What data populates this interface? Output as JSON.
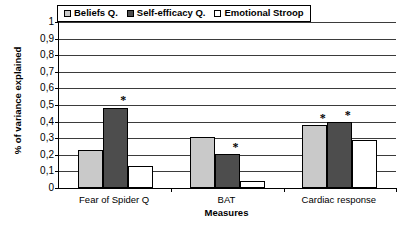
{
  "chart_data": {
    "type": "bar",
    "title": "",
    "xlabel": "Measures",
    "ylabel": "% of variance explained",
    "categories": [
      "Fear of Spider Q",
      "BAT",
      "Cardiac response"
    ],
    "series": [
      {
        "name": "Beliefs Q.",
        "color": "#c9c9c9",
        "values": [
          0.23,
          0.305,
          0.38
        ]
      },
      {
        "name": "Self-efficacy Q.",
        "color": "#4d4d4d",
        "values": [
          0.485,
          0.205,
          0.4
        ]
      },
      {
        "name": "Emotional Stroop",
        "color": "#ffffff",
        "values": [
          0.135,
          0.04,
          0.29
        ]
      }
    ],
    "ylim": [
      0,
      1
    ],
    "ytick_values": [
      0,
      0.1,
      0.2,
      0.3,
      0.4,
      0.5,
      0.6,
      0.7,
      0.8,
      0.9,
      1
    ],
    "ytick_labels": [
      "0",
      "0,1",
      "0,2",
      "0,3",
      "0,4",
      "0,5",
      "0,6",
      "0,7",
      "0,8",
      "0,9",
      "1"
    ],
    "grid": true,
    "legend_position": "top-center",
    "annotations": [
      {
        "symbol": "*",
        "category": "Fear of Spider Q",
        "series": "Self-efficacy Q."
      },
      {
        "symbol": "*",
        "category": "BAT",
        "series": "Self-efficacy Q."
      },
      {
        "symbol": "*",
        "category": "Cardiac response",
        "series": "Beliefs Q."
      },
      {
        "symbol": "*",
        "category": "Cardiac response",
        "series": "Self-efficacy Q."
      }
    ]
  }
}
